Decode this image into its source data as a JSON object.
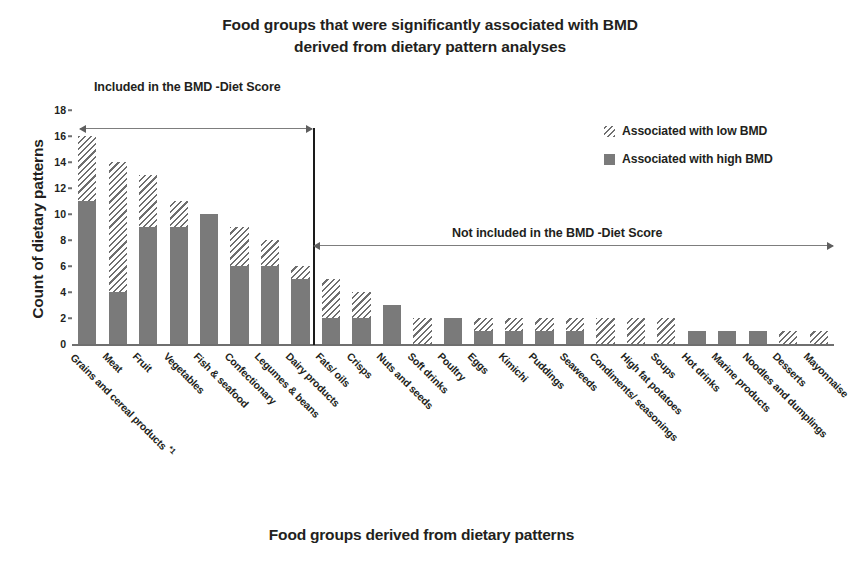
{
  "chart_data": {
    "type": "bar",
    "title": "Food groups that were significantly associated with BMD derived from dietary pattern analyses",
    "title_line1": "Food groups that were significantly associated with BMD",
    "title_line2": "derived from dietary pattern analyses",
    "xlabel": "Food groups derived from dietary patterns",
    "ylabel": "Count of dietary patterns",
    "ylim": [
      0,
      18
    ],
    "yticks": [
      0,
      2,
      4,
      6,
      8,
      10,
      12,
      14,
      16,
      18
    ],
    "grid": false,
    "stacked": true,
    "legend_position": "top-right",
    "categories": [
      "Grains and cereal products *1",
      "Meat",
      "Fruit",
      "Vegetables",
      "Fish & seafood",
      "Confectionary",
      "Legumes & beans",
      "Dairy products",
      "Fats/ oils",
      "Crisps",
      "Nuts and seeds",
      "Soft drinks",
      "Poultry",
      "Eggs",
      "Kimichi",
      "Puddings",
      "Seaweeds",
      "Condiments/ seasonings",
      "High fat potatoes",
      "Soups",
      "Hot drinks",
      "Marine products",
      "Noodles and dumplings",
      "Desserts",
      "Mayonnaise"
    ],
    "series": [
      {
        "name": "Associated with high BMD",
        "color": "#7a7a7a",
        "fill": "solid",
        "values": [
          11,
          4,
          9,
          9,
          10,
          6,
          6,
          5,
          2,
          2,
          3,
          0,
          2,
          1,
          1,
          1,
          1,
          0,
          0,
          0,
          1,
          1,
          1,
          0,
          0
        ]
      },
      {
        "name": "Associated with low BMD",
        "color": "#6f6f6f",
        "fill": "diagonal-hatch",
        "values": [
          5,
          10,
          4,
          2,
          0,
          3,
          2,
          1,
          3,
          2,
          0,
          2,
          0,
          1,
          1,
          1,
          1,
          2,
          2,
          2,
          0,
          0,
          0,
          1,
          1
        ]
      }
    ],
    "totals": [
      16,
      14,
      13,
      11,
      10,
      9,
      8,
      6,
      5,
      4,
      3,
      2,
      2,
      2,
      2,
      2,
      2,
      2,
      2,
      2,
      1,
      1,
      1,
      1,
      1
    ],
    "annotations": [
      {
        "id": "included",
        "text": "Included in the BMD -Diet Score",
        "spans_categories": [
          "Grains and cereal products *1",
          "Dairy products"
        ],
        "arrow": "double-headed"
      },
      {
        "id": "not-included",
        "text": "Not included in the BMD -Diet Score",
        "spans_categories": [
          "Fats/ oils",
          "Mayonnaise"
        ],
        "arrow": "double-headed"
      }
    ],
    "divider_after_category": "Dairy products"
  },
  "legend": {
    "items": [
      {
        "label": "Associated with low BMD",
        "style": "hatched"
      },
      {
        "label": "Associated with high BMD",
        "style": "solid"
      }
    ]
  },
  "footnote_marker": "*1"
}
